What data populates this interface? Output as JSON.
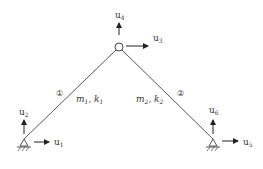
{
  "diagram": {
    "type": "two-element truss / frame with pinned supports",
    "nodes": [
      {
        "id": "left-support",
        "kind": "pinned-support",
        "dofs": [
          {
            "label": "u",
            "sub": "1",
            "dir": "x"
          },
          {
            "label": "u",
            "sub": "2",
            "dir": "y"
          }
        ]
      },
      {
        "id": "apex",
        "kind": "hinge",
        "dofs": [
          {
            "label": "u",
            "sub": "3",
            "dir": "x"
          },
          {
            "label": "u",
            "sub": "4",
            "dir": "y"
          }
        ]
      },
      {
        "id": "right-support",
        "kind": "pinned-support",
        "dofs": [
          {
            "label": "u",
            "sub": "5",
            "dir": "x"
          },
          {
            "label": "u",
            "sub": "6",
            "dir": "y"
          }
        ]
      }
    ],
    "elements": [
      {
        "number": "1",
        "circled": "①",
        "mass": "m",
        "mass_sub": "1",
        "stiffness": "k",
        "stiffness_sub": "1"
      },
      {
        "number": "2",
        "circled": "②",
        "mass": "m",
        "mass_sub": "2",
        "stiffness": "k",
        "stiffness_sub": "2"
      }
    ],
    "labels": {
      "u1": {
        "base": "u",
        "sub": "1"
      },
      "u2": {
        "base": "u",
        "sub": "2"
      },
      "u3": {
        "base": "u",
        "sub": "3"
      },
      "u4": {
        "base": "u",
        "sub": "4"
      },
      "u5": {
        "base": "u",
        "sub": "5"
      },
      "u6": {
        "base": "u",
        "sub": "6"
      },
      "elem1_marker": "①",
      "elem2_marker": "②",
      "elem1_props": {
        "m": "m",
        "m_sub": "1",
        "sep": ", ",
        "k": "k",
        "k_sub": "1"
      },
      "elem2_props": {
        "m": "m",
        "m_sub": "2",
        "sep": ", ",
        "k": "k",
        "k_sub": "2"
      }
    },
    "colors": {
      "line": "#555555",
      "arrow": "#222222",
      "text": "#333333",
      "background": "#ffffff"
    }
  }
}
